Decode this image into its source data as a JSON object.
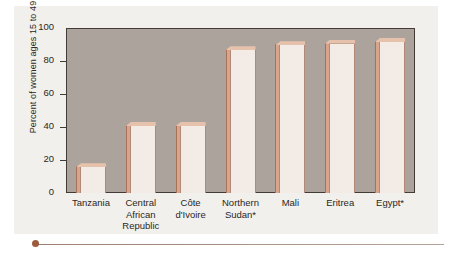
{
  "chart_data": {
    "type": "bar",
    "title": "",
    "xlabel": "",
    "ylabel": "Percent of women ages 15 to 49",
    "ylim": [
      0,
      100
    ],
    "yticks": [
      0,
      20,
      40,
      60,
      80,
      100
    ],
    "grid": false,
    "legend": null,
    "categories": [
      "Tanzania",
      "Central\nAfrican\nRepublic",
      "Côte\nd'Ivoire",
      "Northern\nSudan*",
      "Mali",
      "Eritrea",
      "Egypt*"
    ],
    "values": [
      18,
      43,
      43,
      89,
      92,
      93,
      94
    ],
    "colors": {
      "bar_face": "#f3ece6",
      "bar_edge": "#b08a77",
      "bar_side": "#d9a48c",
      "bar_top": "#e6c2ad",
      "plot_background": "#aba39c",
      "frame": "#423b36",
      "page_background": "#f2f0ec",
      "rule_dot": "#9d5a3c"
    }
  },
  "footnote_marker": "*"
}
